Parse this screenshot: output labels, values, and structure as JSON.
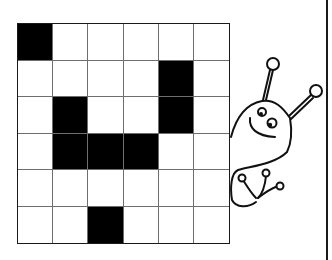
{
  "puzzle": {
    "rows": 6,
    "cols": 6,
    "filled_color": "#000000",
    "empty_color": "#ffffff",
    "grid": [
      [
        1,
        0,
        0,
        0,
        0,
        0
      ],
      [
        0,
        0,
        0,
        0,
        1,
        0
      ],
      [
        0,
        1,
        0,
        0,
        1,
        0
      ],
      [
        0,
        1,
        1,
        1,
        0,
        0
      ],
      [
        0,
        0,
        0,
        0,
        0,
        0
      ],
      [
        0,
        0,
        1,
        0,
        0,
        0
      ]
    ]
  },
  "illustration": {
    "character": "snail-creature-peeking",
    "stroke_color": "#111111"
  }
}
